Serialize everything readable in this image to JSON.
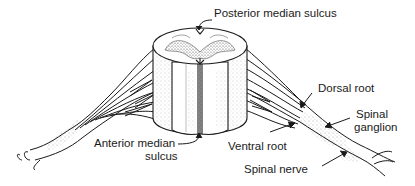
{
  "diagram": {
    "style": "black line art with stippling",
    "colors": {
      "ink": "#1a1a1a",
      "background": "#ffffff",
      "stipple": "#555555"
    },
    "labels": {
      "posterior_median_sulcus": "Posterior median sulcus",
      "dorsal_root": "Dorsal root",
      "spinal_ganglion_line1": "Spinal",
      "spinal_ganglion_line2": "ganglion",
      "anterior_median_sulcus_line1": "Anterior median",
      "anterior_median_sulcus_line2": "sulcus",
      "ventral_root": "Ventral root",
      "spinal_nerve": "Spinal nerve"
    }
  }
}
